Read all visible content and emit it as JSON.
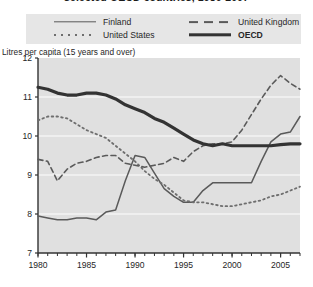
{
  "title": "selected OECD countries, 1980-2007",
  "y_caption": "Litres per capita (15 years and over)",
  "legend": {
    "items": [
      {
        "label": "Finland",
        "style": "solid",
        "bold": false
      },
      {
        "label": "United States",
        "style": "dotted",
        "bold": false
      },
      {
        "label": "United Kingdom",
        "style": "dashed",
        "bold": false
      },
      {
        "label": "OECD",
        "style": "thick",
        "bold": true
      }
    ]
  },
  "colors": {
    "legend_background": "#e6e6e6",
    "plot_background": "#e0e0e0",
    "gridline": "#f5f5f5",
    "axis": "#333333",
    "finland": "#5a5a5a",
    "united_states": "#6e6e6e",
    "united_kingdom": "#5a5a5a",
    "oecd": "#333333"
  },
  "chart_data": {
    "type": "line",
    "title": "selected OECD countries, 1980-2007",
    "xlabel": "",
    "ylabel": "Litres per capita (15 years and over)",
    "xlim": [
      1980,
      2007
    ],
    "ylim": [
      7,
      12
    ],
    "yticks": [
      7,
      8,
      9,
      10,
      11,
      12
    ],
    "xticks": [
      1980,
      1985,
      1990,
      1995,
      2000,
      2005
    ],
    "xtick_labels": [
      "1980",
      "1985",
      "1990",
      "1995",
      "2000",
      "2005"
    ],
    "ytick_labels": [
      "7",
      "8",
      "9",
      "10",
      "11",
      "12"
    ],
    "grid": "horizontal",
    "legend_position": "top",
    "x": [
      1980,
      1981,
      1982,
      1983,
      1984,
      1985,
      1986,
      1987,
      1988,
      1989,
      1990,
      1991,
      1992,
      1993,
      1994,
      1995,
      1996,
      1997,
      1998,
      1999,
      2000,
      2001,
      2002,
      2003,
      2004,
      2005,
      2006,
      2007
    ],
    "series": [
      {
        "name": "Finland",
        "style": "solid",
        "values": [
          7.95,
          7.9,
          7.85,
          7.85,
          7.9,
          7.9,
          7.85,
          8.05,
          8.1,
          8.85,
          9.5,
          9.45,
          9.05,
          8.65,
          8.45,
          8.3,
          8.3,
          8.6,
          8.8,
          8.8,
          8.8,
          8.8,
          8.8,
          9.35,
          9.85,
          10.05,
          10.1,
          10.5
        ]
      },
      {
        "name": "United States",
        "style": "dotted",
        "values": [
          10.4,
          10.5,
          10.5,
          10.45,
          10.3,
          10.15,
          10.05,
          9.95,
          9.75,
          9.55,
          9.35,
          9.1,
          8.9,
          8.75,
          8.55,
          8.35,
          8.3,
          8.3,
          8.25,
          8.2,
          8.2,
          8.25,
          8.3,
          8.35,
          8.45,
          8.5,
          8.6,
          8.7
        ]
      },
      {
        "name": "United Kingdom",
        "style": "dashed",
        "values": [
          9.4,
          9.35,
          8.85,
          9.15,
          9.3,
          9.35,
          9.45,
          9.5,
          9.5,
          9.3,
          9.25,
          9.2,
          9.25,
          9.3,
          9.45,
          9.35,
          9.6,
          9.75,
          9.8,
          9.8,
          9.85,
          10.15,
          10.55,
          10.95,
          11.3,
          11.55,
          11.35,
          11.2
        ]
      },
      {
        "name": "OECD",
        "style": "thick",
        "values": [
          11.25,
          11.2,
          11.1,
          11.05,
          11.05,
          11.1,
          11.1,
          11.05,
          10.95,
          10.8,
          10.7,
          10.6,
          10.45,
          10.35,
          10.2,
          10.05,
          9.9,
          9.8,
          9.75,
          9.8,
          9.75,
          9.75,
          9.75,
          9.75,
          9.75,
          9.78,
          9.8,
          9.8
        ]
      }
    ]
  }
}
